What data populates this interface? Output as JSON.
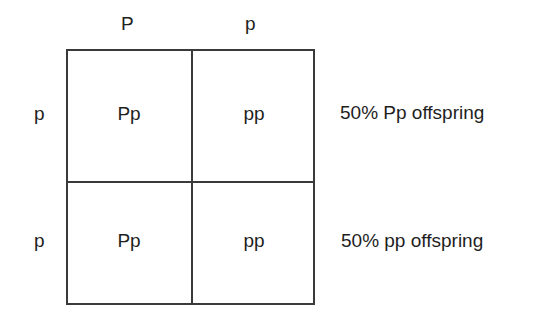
{
  "punnett_square": {
    "column_alleles": [
      "P",
      "p"
    ],
    "row_alleles": [
      "p",
      "p"
    ],
    "cells": [
      [
        "Pp",
        "pp"
      ],
      [
        "Pp",
        "pp"
      ]
    ]
  },
  "results": [
    "50% Pp offspring",
    "50% pp offspring"
  ],
  "colors": {
    "line": "#3a3a3a",
    "text": "#1e1e1e",
    "background": "#ffffff"
  }
}
